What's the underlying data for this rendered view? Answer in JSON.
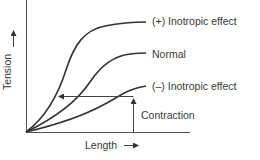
{
  "diagram": {
    "x_axis_label": "Length",
    "y_axis_label": "Tension",
    "axis_arrow": "→",
    "curves": [
      {
        "label": "(+) Inotropic effect"
      },
      {
        "label": "Normal"
      },
      {
        "label": "(–) Inotropic effect"
      }
    ],
    "annotation": "Contraction",
    "colors": {
      "line": "#333333",
      "background": "#ffffff"
    }
  }
}
